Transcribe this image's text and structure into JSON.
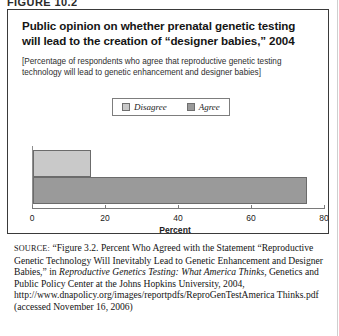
{
  "figure": {
    "label": "FIGURE 10.2",
    "title": "Public opinion on whether prenatal genetic testing will lead to the creation of “designer babies,” 2004",
    "subtitle": "[Percentage of respondents who agree that reproductive genetic testing technology will lead to genetic enhancement and designer babies]"
  },
  "chart_data": {
    "type": "bar",
    "orientation": "horizontal",
    "title": "Public opinion on whether prenatal genetic testing will lead to the creation of “designer babies,” 2004",
    "subtitle": "[Percentage of respondents who agree that reproductive genetic testing technology will lead to genetic enhancement and designer babies]",
    "categories": [
      "Disagree",
      "Agree"
    ],
    "values": [
      16,
      75
    ],
    "xlabel": "Percent",
    "ylabel": "",
    "xlim": [
      0,
      80
    ],
    "xticks": [
      0,
      20,
      40,
      60,
      80
    ],
    "xticklabels": [
      "0",
      "20",
      "40",
      "60",
      "80"
    ],
    "grid": false,
    "legend": {
      "position": "top-center",
      "entries": [
        {
          "label": "Disagree",
          "color": "#c9c9c9"
        },
        {
          "label": "Agree",
          "color": "#9a9a9a"
        }
      ]
    },
    "series": [
      {
        "name": "Disagree",
        "value": 16,
        "color": "#c9c9c9"
      },
      {
        "name": "Agree",
        "value": 75,
        "color": "#9a9a9a"
      }
    ]
  },
  "source": {
    "label": "SOURCE:",
    "lines": [
      "“Figure 3.2. Percent Who Agreed with the Statement",
      "“Reproductive Genetic Technology Will Inevitably Lead to Genetic",
      "Enhancement and Designer Babies,” in ",
      "Reproductive Genetics Testing:",
      "What America Thinks",
      ", Genetics and Public Policy Center at the Johns",
      "Hopkins University, 2004, http://www.dnapolicy.org/images/reportpdfs/",
      "ReproGenTestAmerica Thinks.pdf (accessed November 16, 2006)"
    ]
  }
}
